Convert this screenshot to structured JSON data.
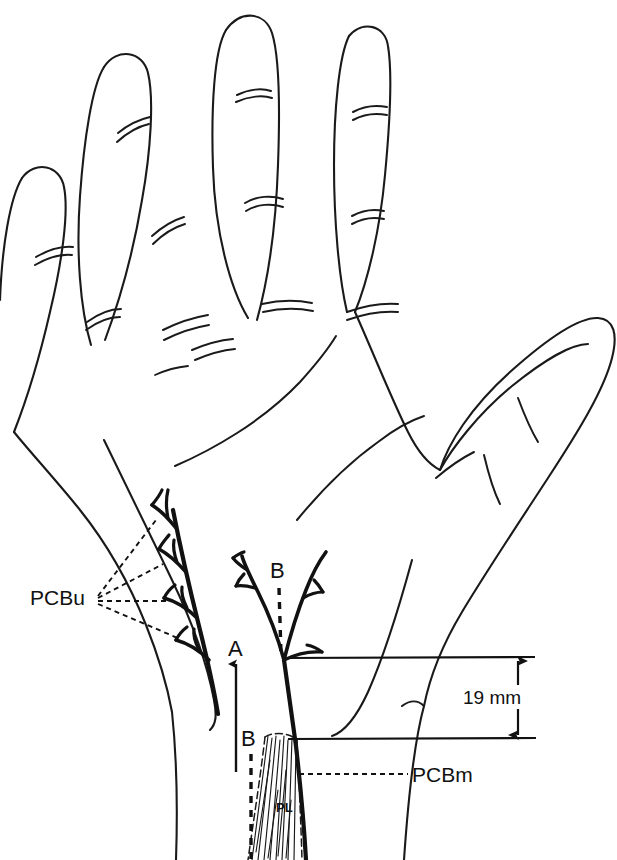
{
  "figure": {
    "type": "anatomical-line-diagram",
    "background_color": "#ffffff",
    "ink_color": "#111111"
  },
  "labels": {
    "pcbu": "PCBu",
    "pcbm": "PCBm",
    "pl": "PL",
    "axis_a": "A",
    "axis_b_upper": "B",
    "axis_b_lower": "B",
    "dimension": "19 mm"
  },
  "measurements": {
    "distance_value": "19 mm",
    "distance_number": 19,
    "distance_unit": "mm"
  },
  "annotations": [
    {
      "name": "pcbu-label",
      "text": "PCBu",
      "leader_count": 4,
      "leader_style": "dashed"
    },
    {
      "name": "pcbm-label",
      "text": "PCBm",
      "leader_count": 1,
      "leader_style": "dashed"
    },
    {
      "name": "pl-label",
      "text": "PL",
      "leader_count": 0,
      "leader_style": "none"
    },
    {
      "name": "axis-a",
      "text": "A",
      "line_style": "solid",
      "arrowhead": "up"
    },
    {
      "name": "axis-b-upper",
      "text": "B",
      "line_style": "dashed",
      "arrowhead": "none"
    },
    {
      "name": "axis-b-lower",
      "text": "B",
      "line_style": "dashed",
      "arrowhead": "none"
    },
    {
      "name": "dimension-19mm",
      "text": "19 mm",
      "line_style": "solid",
      "arrowhead": "both"
    }
  ]
}
